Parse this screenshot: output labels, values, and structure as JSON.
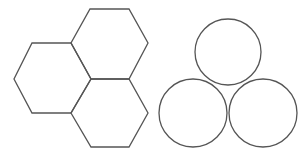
{
  "canvas": {
    "width": 307,
    "height": 156,
    "background": "#ffffff"
  },
  "style": {
    "stroke": "#555555",
    "stroke_width": 1.3
  },
  "hexagons": [
    {
      "name": "hexagon-top",
      "points": "90,9 129,9 148,43 129,79 91,79 71,43"
    },
    {
      "name": "hexagon-left",
      "points": "32,43 71,43 91,79 71,113 32,113 14,79"
    },
    {
      "name": "hexagon-bottom",
      "points": "91,79 129,79 148,113 129,147 91,147 71,113"
    }
  ],
  "circles": [
    {
      "name": "circle-top",
      "cx": 228,
      "cy": 52,
      "r": 33
    },
    {
      "name": "circle-bottom-left",
      "cx": 193,
      "cy": 113,
      "r": 34
    },
    {
      "name": "circle-bottom-right",
      "cx": 263,
      "cy": 113,
      "r": 34
    }
  ]
}
